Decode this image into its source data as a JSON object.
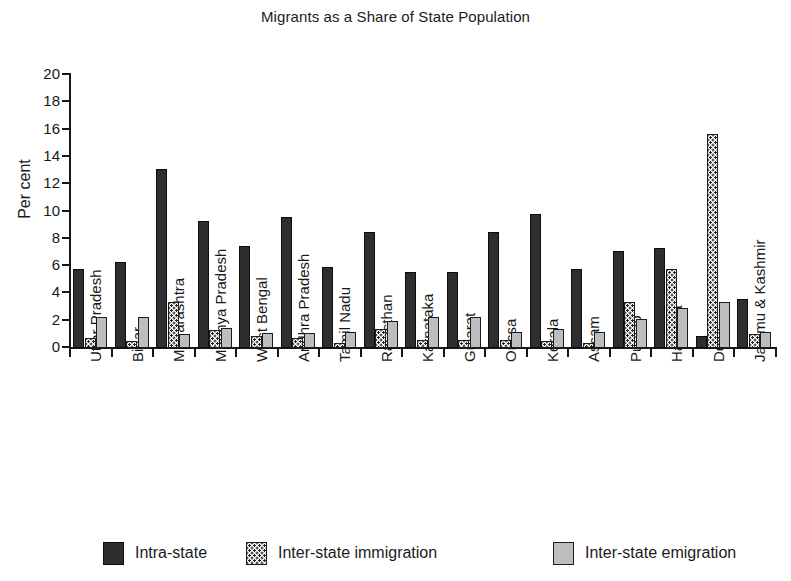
{
  "chart_data": {
    "type": "bar",
    "title": "Migrants as a Share of State Population",
    "xlabel": "",
    "ylabel": "Per cent",
    "ylim": [
      0,
      20
    ],
    "yticks": [
      0,
      2,
      4,
      6,
      8,
      10,
      12,
      14,
      16,
      18,
      20
    ],
    "ytick_labels": [
      "0",
      "2",
      "4",
      "6",
      "8",
      "10",
      "12",
      "14",
      "16",
      "18",
      "20"
    ],
    "grid": false,
    "legend_position": "bottom",
    "categories": [
      "Uttar Pradesh",
      "Bihar",
      "Maharashtra",
      "Madhya Pradesh",
      "West Bengal",
      "Andhra Pradesh",
      "Tamil Nadu",
      "Rajasthan",
      "Karnataka",
      "Gujarat",
      "Orissa",
      "Kerala",
      "Assam",
      "Punjab",
      "Haryana",
      "Delhi",
      "Jammu & Kashmir"
    ],
    "series": [
      {
        "name": "Intra-state",
        "color": "#2e2e2e",
        "pattern": "solid-dark",
        "values": [
          5.8,
          6.3,
          13.1,
          9.3,
          7.5,
          9.6,
          5.9,
          8.5,
          5.6,
          5.6,
          8.5,
          9.8,
          5.8,
          7.1,
          7.3,
          0.9,
          3.6
        ]
      },
      {
        "name": "Inter-state immigration",
        "color": "#ffffff",
        "pattern": "dotted",
        "values": [
          0.7,
          0.5,
          3.4,
          1.3,
          0.9,
          0.7,
          0.4,
          1.4,
          0.6,
          0.6,
          0.6,
          0.5,
          0.4,
          3.4,
          5.8,
          15.7,
          1.0
        ]
      },
      {
        "name": "Inter-state emigration",
        "color": "#bdbdbd",
        "pattern": "solid-light",
        "values": [
          2.3,
          2.3,
          1.0,
          1.5,
          1.1,
          1.1,
          1.2,
          1.95,
          2.3,
          2.3,
          1.2,
          1.4,
          1.2,
          2.1,
          2.9,
          3.4,
          1.2
        ]
      }
    ]
  },
  "legend": {
    "items": [
      {
        "label": "Intra-state"
      },
      {
        "label": "Inter-state immigration"
      },
      {
        "label": "Inter-state emigration"
      }
    ]
  }
}
